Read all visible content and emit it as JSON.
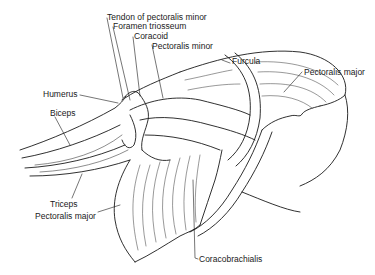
{
  "figure": {
    "labels": {
      "tendon_pectoralis_minor": "Tendon of pectoralis minor",
      "foramen_triosseum": "Foramen triosseum",
      "coracoid": "Coracoid",
      "pectoralis_minor": "Pectoralis minor",
      "furcula": "Furcula",
      "pectoralis_major_right": "Pectoralis major",
      "humerus": "Humerus",
      "biceps": "Biceps",
      "triceps": "Triceps",
      "pectoralis_major_left": "Pectoralis major",
      "coracobrachialis": "Coracobrachialis"
    },
    "colors": {
      "ink": "#1a1a1a",
      "background": "#ffffff"
    }
  }
}
